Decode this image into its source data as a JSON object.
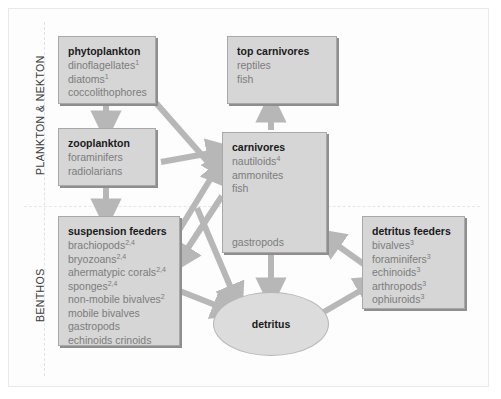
{
  "diagram": {
    "zones": [
      {
        "id": "plankton-nekton",
        "label": "PLANKTON & NEKTON"
      },
      {
        "id": "benthos",
        "label": "BENTHOS"
      }
    ],
    "colors": {
      "box_fill": "#d6d6d6",
      "box_border": "#a8a8a8",
      "box_shadow": "#8e8e8e",
      "ellipse_fill": "#dcdcdc",
      "arrow": "#b7b7b7",
      "title_text": "#1a1a1a",
      "item_text": "#7c7c7c",
      "zone_text": "#3b3b3b",
      "frame_border": "#e9e9e9",
      "background": "#ffffff"
    },
    "nodes": [
      {
        "id": "phytoplankton",
        "shape": "box",
        "title": "phytoplankton",
        "items": [
          {
            "name": "dinoflagellates",
            "sup": "1"
          },
          {
            "name": "diatoms",
            "sup": "1"
          },
          {
            "name": "coccolithophores",
            "sup": ""
          }
        ]
      },
      {
        "id": "top-carnivores",
        "shape": "box",
        "title": "top carnivores",
        "items": [
          {
            "name": "reptiles",
            "sup": ""
          },
          {
            "name": "fish",
            "sup": ""
          }
        ]
      },
      {
        "id": "zooplankton",
        "shape": "box",
        "title": "zooplankton",
        "items": [
          {
            "name": "foraminifers",
            "sup": ""
          },
          {
            "name": "radiolarians",
            "sup": ""
          }
        ]
      },
      {
        "id": "carnivores",
        "shape": "box",
        "title": "carnivores",
        "items": [
          {
            "name": "nautiloids",
            "sup": "4"
          },
          {
            "name": "ammonites",
            "sup": ""
          },
          {
            "name": "fish",
            "sup": ""
          },
          {
            "name": "",
            "sup": "",
            "spacer": true
          },
          {
            "name": "gastropods",
            "sup": ""
          }
        ]
      },
      {
        "id": "suspension-feeders",
        "shape": "box",
        "title": "suspension feeders",
        "items": [
          {
            "name": "brachiopods",
            "sup": "2,4"
          },
          {
            "name": "bryozoans",
            "sup": "2,4"
          },
          {
            "name": "ahermatypic corals",
            "sup": "2,4"
          },
          {
            "name": "sponges",
            "sup": "2,4"
          },
          {
            "name": "non-mobile bivalves",
            "sup": "2"
          },
          {
            "name": "mobile bivalves",
            "sup": ""
          },
          {
            "name": "gastropods",
            "sup": ""
          },
          {
            "name": "echinoids crinoids",
            "sup": ""
          }
        ]
      },
      {
        "id": "detritus-feeders",
        "shape": "box",
        "title": "detritus feeders",
        "items": [
          {
            "name": "bivalves",
            "sup": "3"
          },
          {
            "name": "foraminifers",
            "sup": "3"
          },
          {
            "name": "echinoids",
            "sup": "3"
          },
          {
            "name": "arthropods",
            "sup": "3"
          },
          {
            "name": "ophiuroids",
            "sup": "3"
          }
        ]
      },
      {
        "id": "detritus",
        "shape": "ellipse",
        "title": "detritus",
        "items": []
      }
    ],
    "edges": [
      {
        "from": "phytoplankton",
        "to": "zooplankton"
      },
      {
        "from": "phytoplankton",
        "to": "carnivores"
      },
      {
        "from": "zooplankton",
        "to": "carnivores"
      },
      {
        "from": "zooplankton",
        "to": "suspension-feeders"
      },
      {
        "from": "carnivores",
        "to": "top-carnivores"
      },
      {
        "from": "carnivores",
        "to": "detritus"
      },
      {
        "from": "suspension-feeders",
        "to": "carnivores"
      },
      {
        "from": "suspension-feeders",
        "to": "detritus"
      },
      {
        "from": "detritus",
        "to": "detritus-feeders"
      },
      {
        "from": "detritus-feeders",
        "to": "carnivores"
      },
      {
        "from": "phytoplankton",
        "to": "suspension-feeders"
      }
    ]
  }
}
